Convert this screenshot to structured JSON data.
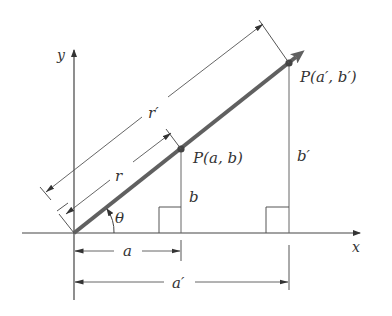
{
  "diagram": {
    "type": "vector-polar-coordinates",
    "axes": {
      "x_label": "x",
      "y_label": "y"
    },
    "points": [
      {
        "name": "P",
        "label_prefix": "P",
        "label_args": "(a, b)",
        "coords": [
          "a",
          "b"
        ]
      },
      {
        "name": "P'",
        "label_prefix": "P",
        "label_args": "(a′, b′)",
        "coords": [
          "a′",
          "b′"
        ]
      }
    ],
    "labels": {
      "p_inner": "P(a, b)",
      "p_outer": "P(a′, b′)",
      "r": "r",
      "r_prime": "r′",
      "a": "a",
      "a_prime": "a′",
      "b": "b",
      "b_prime": "b′",
      "theta": "θ",
      "x": "x",
      "y": "y"
    },
    "colors": {
      "vector": "#606060",
      "lines": "#555555",
      "text": "#333333",
      "background": "#ffffff"
    }
  }
}
